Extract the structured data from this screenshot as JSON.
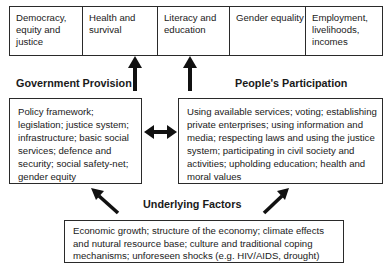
{
  "outcomes": [
    {
      "label": "Democracy, equity and justice"
    },
    {
      "label": "Health and survival"
    },
    {
      "label": "Literacy and education"
    },
    {
      "label": "Gender equality"
    },
    {
      "label": "Employment, livelihoods, incomes"
    }
  ],
  "government": {
    "heading": "Government Provision",
    "text": "Policy framework; legislation; justice system; infrastructure; basic social services; defence and security; social safety-net; gender equity"
  },
  "people": {
    "heading": "People's Participation",
    "text": "Using available services; voting; establishing private enterprises; using information and media; respecting laws and using the justice system; participating in civil society and activities; upholding education; health and moral values"
  },
  "underlying": {
    "heading": "Underlying Factors",
    "text": "Economic growth; structure of the economy; climate effects and nutural resource base; culture and traditional coping mechanisms; unforeseen shocks (e.g. HIV/AIDS, drought)"
  },
  "colors": {
    "line": "#2a2a2a",
    "arrow": "#111111",
    "background": "#ffffff"
  }
}
